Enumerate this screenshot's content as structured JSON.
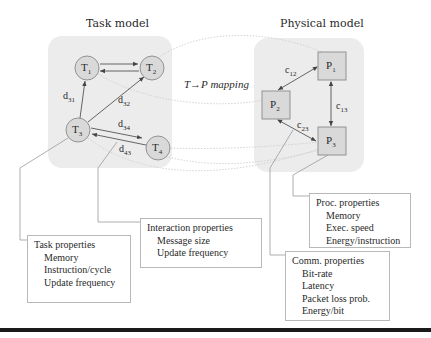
{
  "task_model": {
    "title": "Task model",
    "nodes": [
      {
        "id": "T1",
        "label": "T",
        "sub": "1"
      },
      {
        "id": "T2",
        "label": "T",
        "sub": "2"
      },
      {
        "id": "T3",
        "label": "T",
        "sub": "3"
      },
      {
        "id": "T4",
        "label": "T",
        "sub": "4"
      }
    ],
    "edges": [
      {
        "from": "T1",
        "to": "T2",
        "label": ""
      },
      {
        "from": "T2",
        "to": "T1",
        "label": ""
      },
      {
        "from": "T3",
        "to": "T1",
        "label": "d",
        "sub": "31"
      },
      {
        "from": "T3",
        "to": "T2",
        "label": "d",
        "sub": "32"
      },
      {
        "from": "T3",
        "to": "T4",
        "label": "d",
        "sub": "34"
      },
      {
        "from": "T4",
        "to": "T3",
        "label": "d",
        "sub": "43"
      }
    ]
  },
  "physical_model": {
    "title": "Physical model",
    "nodes": [
      {
        "id": "P1",
        "label": "P",
        "sub": "1"
      },
      {
        "id": "P2",
        "label": "P",
        "sub": "2"
      },
      {
        "id": "P3",
        "label": "P",
        "sub": "3"
      }
    ],
    "edges": [
      {
        "a": "P1",
        "b": "P2",
        "label": "c",
        "sub": "12"
      },
      {
        "a": "P1",
        "b": "P3",
        "label": "c",
        "sub": "13"
      },
      {
        "a": "P2",
        "b": "P3",
        "label": "c",
        "sub": "23"
      }
    ]
  },
  "mapping": {
    "label": "T→P mapping"
  },
  "task_properties": {
    "title": "Task properties",
    "items": [
      "Memory",
      "Instruction/cycle",
      "Update frequency"
    ]
  },
  "interaction_properties": {
    "title": "Interaction properties",
    "items": [
      "Message size",
      "Update frequency"
    ]
  },
  "proc_properties": {
    "title": "Proc. properties",
    "items": [
      "Memory",
      "Exec. speed",
      "Energy/instruction"
    ]
  },
  "comm_properties": {
    "title": "Comm. properties",
    "items": [
      "Bit-rate",
      "Latency",
      "Packet loss prob.",
      "Energy/bit"
    ]
  },
  "colors": {
    "panel_bg": "#ececec",
    "node_fill": "#d9d9d9",
    "node_stroke": "#8a8a8a",
    "edge": "#555555",
    "mapping_line": "#cfcfcf",
    "connector": "#9a9a9a"
  }
}
